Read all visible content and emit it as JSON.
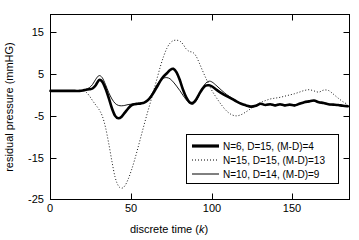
{
  "chart_data": {
    "type": "line",
    "title": "",
    "xlabel": "discrete time (k)",
    "ylabel": "residual pressure (mmHG)",
    "xlim": [
      0,
      185
    ],
    "ylim": [
      -27,
      19
    ],
    "xticks": [
      0,
      50,
      100,
      150
    ],
    "yticks": [
      15,
      5,
      -5,
      -15,
      -25
    ],
    "xticklabels": [
      "0",
      "50",
      "100",
      "150"
    ],
    "yticklabels": [
      "15",
      "5",
      "-5",
      "-15",
      "-25"
    ],
    "grid": false,
    "legend_position": "lower right",
    "series": [
      {
        "name": "N=6, D=15, (M-D)=4",
        "style": "thick-solid",
        "color": "#000000",
        "x": [
          0,
          5,
          10,
          15,
          18,
          20,
          22,
          24,
          26,
          28,
          30,
          32,
          34,
          36,
          38,
          40,
          42,
          44,
          46,
          48,
          50,
          52,
          54,
          56,
          58,
          60,
          62,
          64,
          66,
          68,
          70,
          72,
          74,
          76,
          78,
          80,
          82,
          84,
          86,
          88,
          90,
          92,
          94,
          96,
          98,
          100,
          103,
          106,
          109,
          112,
          115,
          118,
          121,
          124,
          127,
          130,
          133,
          136,
          139,
          142,
          145,
          148,
          151,
          154,
          157,
          160,
          163,
          166,
          169,
          172,
          175,
          178,
          181,
          184
        ],
        "y": [
          0,
          0,
          0,
          0,
          0,
          0.1,
          0.3,
          0.4,
          0.6,
          1.4,
          2.7,
          2.3,
          0.6,
          -1.7,
          -4.3,
          -6.2,
          -6.8,
          -6.4,
          -5.4,
          -4.4,
          -3.6,
          -3.3,
          -3.2,
          -3.1,
          -2.9,
          -2.4,
          -1.5,
          -0.3,
          1.1,
          2.5,
          3.6,
          4.4,
          5.2,
          5.5,
          4.6,
          2.7,
          0.3,
          -1.6,
          -2.8,
          -3.0,
          -2.2,
          -0.8,
          0.5,
          1.3,
          1.4,
          1.1,
          0.2,
          -0.6,
          -1.3,
          -1.9,
          -2.6,
          -3.2,
          -3.6,
          -3.9,
          -3.7,
          -3.2,
          -3.5,
          -3.3,
          -3.6,
          -3.3,
          -3.6,
          -3.4,
          -3.6,
          -3.2,
          -2.8,
          -2.6,
          -2.4,
          -2.8,
          -3.0,
          -3.3,
          -3.4,
          -3.5,
          -3.7,
          -3.8
        ]
      },
      {
        "name": "N=15, D=15, (M-D)=13",
        "style": "dotted",
        "color": "#000000",
        "x": [
          0,
          5,
          10,
          15,
          18,
          20,
          22,
          24,
          26,
          28,
          30,
          32,
          34,
          36,
          38,
          40,
          42,
          44,
          46,
          48,
          50,
          52,
          54,
          56,
          58,
          60,
          62,
          64,
          66,
          68,
          70,
          72,
          74,
          76,
          78,
          80,
          82,
          84,
          86,
          88,
          90,
          92,
          94,
          96,
          98,
          100,
          103,
          106,
          109,
          112,
          115,
          118,
          121,
          124,
          127,
          130,
          133,
          136,
          139,
          142,
          145,
          148,
          151,
          154,
          157,
          160,
          163,
          166,
          169,
          172,
          175,
          178,
          181,
          184
        ],
        "y": [
          0,
          0,
          0,
          0,
          0,
          0,
          -0.3,
          -1.2,
          -2.4,
          -3.5,
          -4.6,
          -6.2,
          -9.0,
          -13.0,
          -17.5,
          -21.5,
          -23.6,
          -24.2,
          -23.6,
          -22.0,
          -19.8,
          -17.2,
          -14.3,
          -11.3,
          -8.3,
          -5.4,
          -2.6,
          0.3,
          3.2,
          6.1,
          8.6,
          10.6,
          11.9,
          12.5,
          12.6,
          12.4,
          11.6,
          10.4,
          9.8,
          9.6,
          8.7,
          7.0,
          5.1,
          3.3,
          1.6,
          0.0,
          -1.9,
          -3.6,
          -5.0,
          -5.9,
          -6.2,
          -5.9,
          -5.2,
          -4.4,
          -3.6,
          -2.9,
          -2.4,
          -2.0,
          -1.8,
          -1.6,
          -1.3,
          -1.0,
          -0.7,
          -0.3,
          0.1,
          0.3,
          0.0,
          -0.3,
          0.2,
          0.1,
          -0.8,
          -1.8,
          -2.7,
          -3.4
        ]
      },
      {
        "name": "N=10, D=14, (M-D)=9",
        "style": "thin-solid",
        "color": "#000000",
        "x": [
          0,
          5,
          10,
          15,
          18,
          20,
          22,
          24,
          26,
          28,
          30,
          32,
          34,
          36,
          38,
          40,
          42,
          44,
          46,
          48,
          50,
          52,
          54,
          56,
          58,
          60,
          62,
          64,
          66,
          68,
          70,
          72,
          74,
          76,
          78,
          80,
          82,
          84,
          86,
          88,
          90,
          92,
          94,
          96,
          98,
          100,
          103,
          106,
          109,
          112,
          115,
          118,
          121,
          124,
          127,
          130,
          133,
          136,
          139,
          142,
          145,
          148,
          151,
          154,
          157,
          160,
          163,
          166,
          169,
          172,
          175,
          178,
          181,
          184
        ],
        "y": [
          0,
          0,
          0,
          0,
          0,
          0.1,
          0.4,
          0.8,
          1.6,
          2.9,
          3.8,
          3.3,
          1.6,
          -0.4,
          -2.0,
          -3.1,
          -3.6,
          -3.7,
          -3.6,
          -3.4,
          -3.3,
          -3.2,
          -3.2,
          -3.1,
          -2.8,
          -2.2,
          -1.2,
          0.2,
          1.6,
          2.7,
          3.2,
          3.3,
          3.0,
          2.2,
          1.2,
          0.1,
          -1.1,
          -2.2,
          -3.0,
          -3.3,
          -2.6,
          -1.0,
          0.7,
          1.9,
          2.4,
          2.2,
          1.2,
          0.1,
          -0.9,
          -1.7,
          -2.5,
          -3.2,
          -3.7,
          -4.0,
          -3.8,
          -3.3,
          -3.6,
          -3.4,
          -3.7,
          -3.4,
          -3.7,
          -3.5,
          -3.7,
          -3.3,
          -2.9,
          -2.7,
          -2.5,
          -2.9,
          -3.1,
          -3.4,
          -3.5,
          -3.6,
          -3.8,
          -3.9
        ]
      }
    ]
  },
  "legend": {
    "entries": [
      {
        "label": "N=6, D=15, (M-D)=4",
        "style": "thick-solid"
      },
      {
        "label": "N=15, D=15, (M-D)=13",
        "style": "dotted"
      },
      {
        "label": "N=10, D=14, (M-D)=9",
        "style": "thin-solid"
      }
    ]
  },
  "axes": {
    "xlabel_text": "discrete time (",
    "xlabel_italic": "k",
    "xlabel_close": ")",
    "ylabel_text": "residual pressure (mmHG)"
  }
}
